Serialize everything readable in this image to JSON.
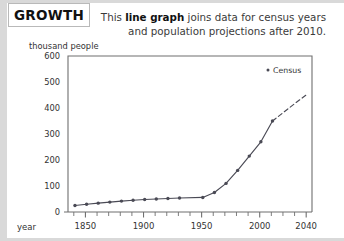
{
  "title": "GROWTH",
  "caption": {
    "line1_pre": "This ",
    "line1_bold": "line graph",
    "line1_post": " joins data for census years",
    "line2": "and population projections after 2010."
  },
  "legend": {
    "marker": "census-dot",
    "label": "Census"
  },
  "chart_data": {
    "type": "line",
    "title": "GROWTH",
    "xlabel": "year",
    "ylabel": "thousand people",
    "xlim": [
      1835,
      2045
    ],
    "ylim": [
      0,
      600
    ],
    "grid": false,
    "legend_position": "top-right-inside",
    "x_major_ticks": [
      1850,
      1900,
      1950,
      2000,
      2040
    ],
    "x_major_tick_labels": [
      "1850",
      "1900",
      "1950",
      "2000",
      "2040"
    ],
    "x_minor_tick_step": 10,
    "y_ticks": [
      0,
      100,
      200,
      300,
      400,
      500,
      600
    ],
    "y_tick_labels": [
      "0",
      "100",
      "200",
      "300",
      "400",
      "500",
      "600"
    ],
    "series": [
      {
        "name": "Census",
        "style": "solid-with-markers",
        "x": [
          1841,
          1851,
          1861,
          1871,
          1881,
          1891,
          1901,
          1911,
          1921,
          1931,
          1951,
          1961,
          1971,
          1981,
          1991,
          2001,
          2011
        ],
        "values": [
          25,
          30,
          34,
          38,
          42,
          45,
          48,
          50,
          52,
          54,
          56,
          75,
          110,
          160,
          215,
          270,
          350
        ]
      },
      {
        "name": "Projection",
        "style": "dashed",
        "x": [
          2011,
          2021,
          2031,
          2040
        ],
        "values": [
          350,
          385,
          420,
          450
        ]
      }
    ]
  }
}
